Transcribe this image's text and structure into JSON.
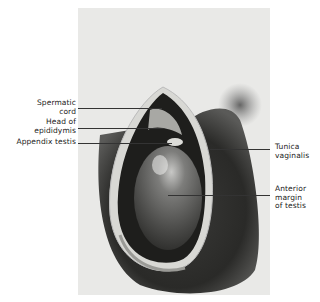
{
  "figure": {
    "labels": {
      "spermatic_cord": [
        "Spermatic",
        "cord"
      ],
      "head_of_epididymis": [
        "Head of",
        "epididymis"
      ],
      "appendix_testis": [
        "Appendix testis"
      ],
      "tunica_vaginalis": [
        "Tunica",
        "vaginalis"
      ],
      "anterior_margin": [
        "Anterior",
        "margin",
        "of testis"
      ]
    }
  }
}
